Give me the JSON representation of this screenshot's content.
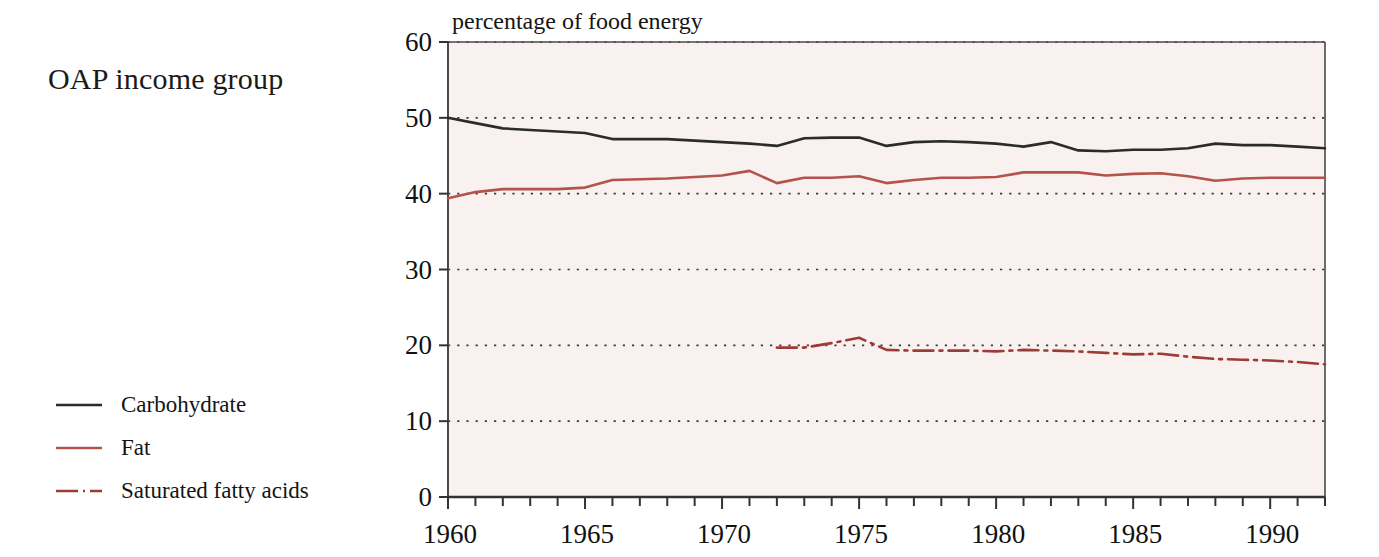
{
  "figure": {
    "side_title": "OAP income group",
    "axis_title": "percentage of food energy",
    "background_color": "#f9f1ef",
    "page_color": "#ffffff"
  },
  "legend": {
    "position": "left-bottom",
    "items": [
      {
        "label": "Carbohydrate",
        "color": "#2b2b2b",
        "style": "solid",
        "key_name": "legend-key-carbohydrate"
      },
      {
        "label": "Fat",
        "color": "#b4534b",
        "style": "solid",
        "key_name": "legend-key-fat"
      },
      {
        "label": "Saturated fatty acids",
        "color": "#9d3c34",
        "style": "dashdot",
        "key_name": "legend-key-saturated-fatty-acids"
      }
    ]
  },
  "axes": {
    "y": {
      "label": "percentage of food energy",
      "min": 0,
      "max": 60,
      "ticks": [
        0,
        10,
        20,
        30,
        40,
        50,
        60
      ],
      "tick_labels": [
        "0",
        "10",
        "20",
        "30",
        "40",
        "50",
        "60"
      ],
      "grid": "dotted"
    },
    "x": {
      "label": "",
      "min": 1960,
      "max": 1992,
      "ticks": [
        1960,
        1961,
        1962,
        1963,
        1964,
        1965,
        1966,
        1967,
        1968,
        1969,
        1970,
        1971,
        1972,
        1973,
        1974,
        1975,
        1976,
        1977,
        1978,
        1979,
        1980,
        1981,
        1982,
        1983,
        1984,
        1985,
        1986,
        1987,
        1988,
        1989,
        1990,
        1991,
        1992
      ],
      "major_ticks": [
        1960,
        1965,
        1970,
        1975,
        1980,
        1985,
        1990
      ],
      "tick_labels": [
        "1960",
        "1965",
        "1970",
        "1975",
        "1980",
        "1985",
        "1990"
      ],
      "grid": "none"
    }
  },
  "chart_data": {
    "type": "line",
    "title": "OAP income group",
    "subtitle": "",
    "xlabel": "",
    "ylabel": "percentage of food energy",
    "xlim": [
      1960,
      1992
    ],
    "ylim": [
      0,
      60
    ],
    "grid": "horizontal-dotted",
    "legend_position": "left-outside",
    "x": [
      1960,
      1961,
      1962,
      1963,
      1964,
      1965,
      1966,
      1967,
      1968,
      1969,
      1970,
      1971,
      1972,
      1973,
      1974,
      1975,
      1976,
      1977,
      1978,
      1979,
      1980,
      1981,
      1982,
      1983,
      1984,
      1985,
      1986,
      1987,
      1988,
      1989,
      1990,
      1991,
      1992
    ],
    "series": [
      {
        "name": "Carbohydrate",
        "color": "#2b2b2b",
        "style": "solid",
        "values": [
          50.0,
          49.3,
          48.6,
          48.4,
          48.2,
          48.0,
          47.2,
          47.2,
          47.2,
          47.0,
          46.8,
          46.6,
          46.3,
          47.3,
          47.4,
          47.4,
          46.3,
          46.8,
          46.9,
          46.8,
          46.6,
          46.2,
          46.8,
          45.7,
          45.6,
          45.8,
          45.8,
          46.0,
          46.6,
          46.4,
          46.4,
          46.2,
          46.0
        ]
      },
      {
        "name": "Fat",
        "color": "#b4534b",
        "style": "solid",
        "values": [
          39.4,
          40.2,
          40.6,
          40.6,
          40.6,
          40.8,
          41.8,
          41.9,
          42.0,
          42.2,
          42.4,
          43.0,
          41.4,
          42.1,
          42.1,
          42.3,
          41.4,
          41.8,
          42.1,
          42.1,
          42.2,
          42.8,
          42.8,
          42.8,
          42.4,
          42.6,
          42.7,
          42.3,
          41.7,
          42.0,
          42.1,
          42.1,
          42.1
        ]
      },
      {
        "name": "Saturated fatty acids",
        "color": "#9d3c34",
        "style": "dashdot",
        "x_start": 1972,
        "values": [
          null,
          null,
          null,
          null,
          null,
          null,
          null,
          null,
          null,
          null,
          null,
          null,
          19.7,
          19.7,
          20.3,
          21.0,
          19.4,
          19.3,
          19.3,
          19.3,
          19.2,
          19.4,
          19.3,
          19.2,
          19.0,
          18.8,
          18.9,
          18.5,
          18.2,
          18.1,
          18.0,
          17.8,
          17.5
        ]
      }
    ]
  }
}
